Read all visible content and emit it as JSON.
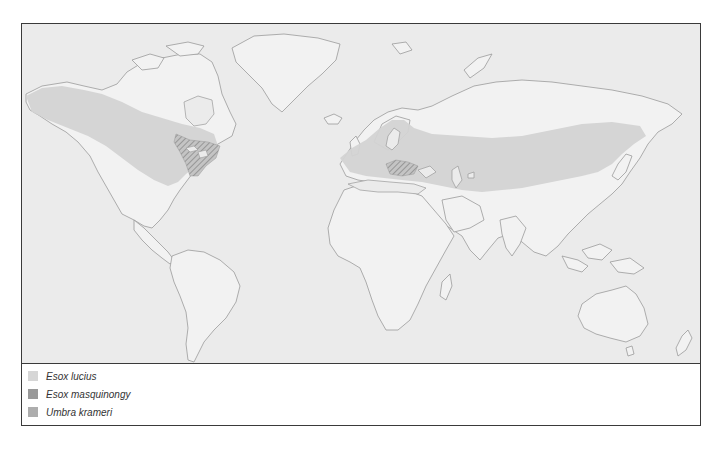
{
  "map": {
    "type": "world distribution map",
    "colors": {
      "ocean": "#ebebeb",
      "land": "#f2f2f2",
      "coastline": "#9a9a9a",
      "esox_lucius": "#d6d6d6",
      "esox_masquinongy": "#999999",
      "umbra_krameri": "#adadad"
    },
    "regions": [
      {
        "species": "Esox lucius",
        "area": "Northern North America (Alaska, Canada, northern USA) and northern Eurasia (Europe to Siberia)"
      },
      {
        "species": "Esox masquinongy",
        "area": "Great Lakes / St. Lawrence region of eastern North America (hatched)"
      },
      {
        "species": "Umbra krameri",
        "area": "Danube basin, central/eastern Europe (hatched)"
      }
    ]
  },
  "legend": {
    "items": [
      {
        "label": "Esox lucius",
        "color": "#d6d6d6"
      },
      {
        "label": "Esox masquinongy",
        "color": "#999999"
      },
      {
        "label": "Umbra krameri",
        "color": "#adadad"
      }
    ]
  }
}
